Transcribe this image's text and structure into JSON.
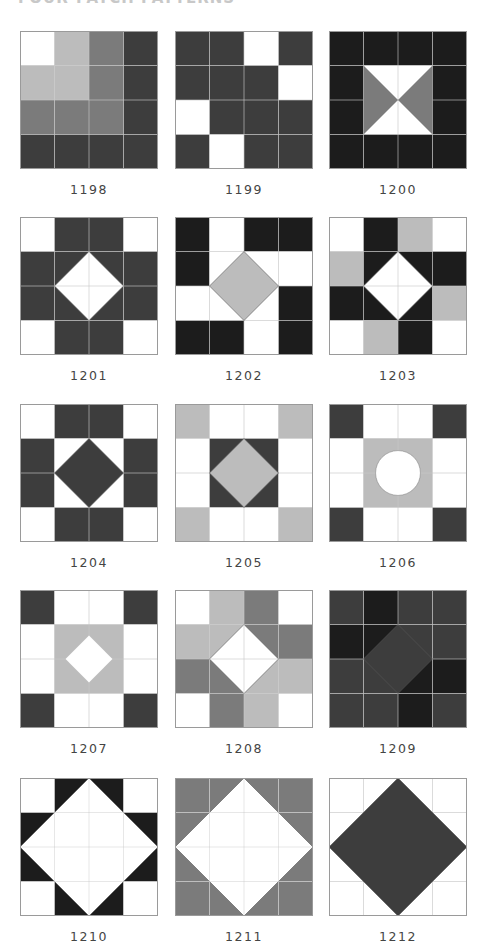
{
  "heading": "FOUR-PATCH PATTERNS",
  "colors": {
    "W": "#ffffff",
    "L": "#bcbcbc",
    "M": "#7b7b7b",
    "D": "#3d3d3d",
    "K": "#1c1c1c",
    "grid": "#c8c8c8",
    "outline": "#9a9a9a"
  },
  "blocks": [
    {
      "id": "1198",
      "label": "1198",
      "x": 20,
      "y": 31,
      "cells": [
        "WLMD",
        "LLMD",
        "MMMD",
        "DDDD"
      ],
      "overlay": "none"
    },
    {
      "id": "1199",
      "label": "1199",
      "x": 175,
      "y": 31,
      "cells": [
        "DDWD",
        "DDDW",
        "WDDD",
        "DWDD"
      ],
      "overlay": "none"
    },
    {
      "id": "1200",
      "label": "1200",
      "x": 329,
      "y": 31,
      "cells": [
        "KKKK",
        "KWWK",
        "KWWK",
        "KKKK"
      ],
      "overlay": "hourglass",
      "overlay_fill": "M",
      "center_bg": "W"
    },
    {
      "id": "1201",
      "label": "1201",
      "x": 20,
      "y": 217,
      "cells": [
        "WDDW",
        "DDDD",
        "DDDD",
        "WDDW"
      ],
      "overlay": "diamond",
      "overlay_fill": "W"
    },
    {
      "id": "1202",
      "label": "1202",
      "x": 175,
      "y": 217,
      "cells": [
        "KWKK",
        "KWWW",
        "WWWK",
        "KKWK"
      ],
      "overlay": "diamond",
      "overlay_fill": "L"
    },
    {
      "id": "1203",
      "label": "1203",
      "x": 329,
      "y": 217,
      "cells": [
        "WKLW",
        "LKKK",
        "KKKL",
        "WLKW"
      ],
      "overlay": "diamond",
      "overlay_fill": "W"
    },
    {
      "id": "1204",
      "label": "1204",
      "x": 20,
      "y": 404,
      "cells": [
        "WDDW",
        "DWWD",
        "DWWD",
        "WDDW"
      ],
      "overlay": "diamond",
      "overlay_fill": "D"
    },
    {
      "id": "1205",
      "label": "1205",
      "x": 175,
      "y": 404,
      "cells": [
        "LWWL",
        "WDDW",
        "WDDW",
        "LWWL"
      ],
      "overlay": "diamond",
      "overlay_fill": "L"
    },
    {
      "id": "1206",
      "label": "1206",
      "x": 329,
      "y": 404,
      "cells": [
        "DWWD",
        "WLLW",
        "WLLW",
        "DWWD"
      ],
      "overlay": "circle",
      "overlay_fill": "W"
    },
    {
      "id": "1207",
      "label": "1207",
      "x": 20,
      "y": 590,
      "cells": [
        "DWWD",
        "WLLW",
        "WLLW",
        "DWWD"
      ],
      "overlay": "small-diamond",
      "overlay_fill": "W"
    },
    {
      "id": "1208",
      "label": "1208",
      "x": 175,
      "y": 590,
      "cells": [
        "WLMW",
        "LLMM",
        "MMLL",
        "WMLW"
      ],
      "overlay": "diamond",
      "overlay_fill": "W"
    },
    {
      "id": "1209",
      "label": "1209",
      "x": 329,
      "y": 590,
      "cells": [
        "DKDD",
        "KKDD",
        "DDKK",
        "DDKD"
      ],
      "overlay": "diamond",
      "overlay_fill": "D"
    },
    {
      "id": "1210",
      "label": "1210",
      "x": 20,
      "y": 778,
      "cells": [
        "WKKW",
        "KWWK",
        "KWWK",
        "WKKW"
      ],
      "overlay": "big-diamond",
      "overlay_fill": "W"
    },
    {
      "id": "1211",
      "label": "1211",
      "x": 175,
      "y": 778,
      "cells": [
        "MMMM",
        "MMMM",
        "MMMM",
        "MMMM"
      ],
      "overlay": "big-diamond",
      "overlay_fill": "W"
    },
    {
      "id": "1212",
      "label": "1212",
      "x": 329,
      "y": 778,
      "cells": [
        "WWWW",
        "WWWW",
        "WWWW",
        "WWWW"
      ],
      "overlay": "big-diamond",
      "overlay_fill": "D"
    }
  ]
}
